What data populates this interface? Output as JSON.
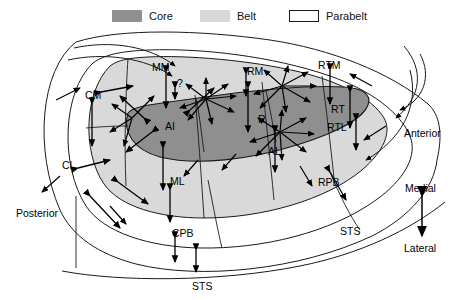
{
  "legend": {
    "items": [
      {
        "label": "Core",
        "swatch": "core-swatch",
        "color": "#8f8f8f",
        "x": 112,
        "y": 10
      },
      {
        "label": "Belt",
        "swatch": "belt-swatch",
        "color": "#d9d9d9",
        "x": 200,
        "y": 10
      },
      {
        "label": "Parabelt",
        "swatch": "parabelt-swatch",
        "color": "#ffffff",
        "x": 289,
        "y": 10
      }
    ]
  },
  "diagram": {
    "colors": {
      "core": "#8f8f8f",
      "belt": "#d9d9d9",
      "parabelt": "#ffffff",
      "outline": "#1a1a1a",
      "arrow": "#000000"
    },
    "field_labels": [
      {
        "name": "MM",
        "text": "MM",
        "x": 152,
        "y": 62,
        "region": "belt"
      },
      {
        "name": "Q",
        "text": "?",
        "x": 177,
        "y": 78,
        "region": "belt"
      },
      {
        "name": "RM",
        "text": "RM",
        "x": 247,
        "y": 66,
        "region": "belt"
      },
      {
        "name": "RTM",
        "text": "RTM",
        "x": 318,
        "y": 60,
        "region": "belt"
      },
      {
        "name": "CM",
        "text": "CM",
        "x": 85,
        "y": 90,
        "region": "belt"
      },
      {
        "name": "AI",
        "text": "AI",
        "x": 165,
        "y": 121,
        "region": "core"
      },
      {
        "name": "R",
        "text": "R",
        "x": 258,
        "y": 114,
        "region": "core"
      },
      {
        "name": "RT",
        "text": "RT",
        "x": 331,
        "y": 104,
        "region": "core"
      },
      {
        "name": "RTL",
        "text": "RTL",
        "x": 327,
        "y": 122,
        "region": "belt"
      },
      {
        "name": "CL",
        "text": "CL",
        "x": 62,
        "y": 160,
        "region": "belt"
      },
      {
        "name": "ML",
        "text": "ML",
        "x": 170,
        "y": 176,
        "region": "belt"
      },
      {
        "name": "AL",
        "text": "AL",
        "x": 268,
        "y": 146,
        "region": "belt"
      },
      {
        "name": "RPB",
        "text": "RPB",
        "x": 318,
        "y": 177,
        "region": "parabelt"
      },
      {
        "name": "CPB",
        "text": "CPB",
        "x": 172,
        "y": 228,
        "region": "parabelt"
      },
      {
        "name": "STS-right",
        "text": "STS",
        "x": 340,
        "y": 226,
        "region": "sulcus"
      },
      {
        "name": "STS-bottom",
        "text": "STS",
        "x": 192,
        "y": 281,
        "region": "sulcus"
      }
    ],
    "orientation": {
      "anterior": "Anterior",
      "posterior": "Posterior",
      "medial": "Medial",
      "lateral": "Lateral",
      "anterior_pos": {
        "x": 404,
        "y": 128
      },
      "posterior_pos": {
        "x": 16,
        "y": 208
      },
      "medial_pos": {
        "x": 410,
        "y": 183
      },
      "lateral_pos": {
        "x": 409,
        "y": 243
      }
    }
  }
}
